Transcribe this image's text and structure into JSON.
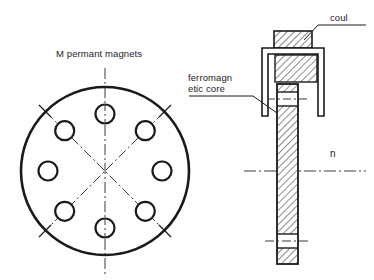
{
  "figure": {
    "title_note": "M permant magnets",
    "labels": {
      "magnets": "M permant magnets",
      "core_line1": "ferromagn",
      "core_line2": "etic core",
      "coil": "coul",
      "axis": "n"
    },
    "colors": {
      "stroke": "#1a1a1a",
      "background": "#ffffff",
      "hatch": "#1a1a1a",
      "centerline": "#3a3a3a"
    }
  },
  "front_view": {
    "name": "rotor-face-view",
    "outer_circle": {
      "cx": 105,
      "cy": 171,
      "r": 84,
      "stroke_width": 2.6
    },
    "magnet_circle_radius": 57,
    "magnet_hole_radius": 9.5,
    "magnet_count": 8,
    "magnet_angles_deg": [
      90,
      45,
      0,
      315,
      270,
      225,
      180,
      135
    ],
    "centerlines": [
      {
        "type": "vertical",
        "angle_deg": 90
      },
      {
        "type": "diagonal",
        "angle_deg": 45
      },
      {
        "type": "diagonal",
        "angle_deg": 135
      }
    ],
    "tick_marks_deg": [
      45,
      135,
      225,
      315
    ]
  },
  "section_view": {
    "name": "coil-core-section",
    "coil_top_block": {
      "x": 274,
      "y": 31,
      "w": 38,
      "h": 17
    },
    "bobbin_outline": {
      "x": 262,
      "y": 48,
      "w": 62,
      "h": 68
    },
    "coil_inner_block": {
      "x": 275,
      "y": 55,
      "w": 42,
      "h": 27
    },
    "core_shaft": {
      "x": 277,
      "y": 84,
      "w": 21,
      "h": 180
    },
    "core_gap_upper": {
      "y": 92,
      "h": 14
    },
    "core_gap_lower": {
      "y": 234,
      "h": 14
    },
    "axis_line_y": 171,
    "hatch_spacing_px": 5,
    "hatch_angle_deg": 45
  }
}
